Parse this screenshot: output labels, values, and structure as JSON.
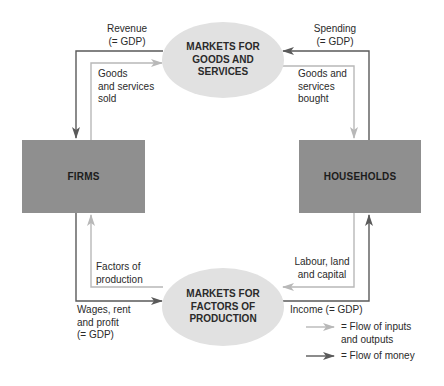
{
  "diagram": {
    "type": "circular-flow",
    "nodes": {
      "firms": {
        "label": "FIRMS"
      },
      "households": {
        "label": "HOUSEHOLDS"
      },
      "goods_market": {
        "label": "MARKETS FOR\nGOODS AND\nSERVICES"
      },
      "factor_market": {
        "label": "MARKETS FOR\nFACTORS OF\nPRODUCTION"
      }
    },
    "flows": {
      "revenue": {
        "label": "Revenue\n(= GDP)",
        "kind": "money",
        "from": "goods_market",
        "to": "firms"
      },
      "goods_sold": {
        "label": "Goods\nand services\nsold",
        "kind": "inputs_outputs",
        "from": "firms",
        "to": "goods_market"
      },
      "spending": {
        "label": "Spending\n(= GDP)",
        "kind": "money",
        "from": "households",
        "to": "goods_market"
      },
      "goods_bought": {
        "label": "Goods and\nservices\nbought",
        "kind": "inputs_outputs",
        "from": "goods_market",
        "to": "households"
      },
      "factors": {
        "label": "Factors of\nproduction",
        "kind": "inputs_outputs",
        "from": "factor_market",
        "to": "firms"
      },
      "wages": {
        "label": "Wages, rent\nand profit\n(= GDP)",
        "kind": "money",
        "from": "firms",
        "to": "factor_market"
      },
      "labour": {
        "label": "Labour, land\nand capital",
        "kind": "inputs_outputs",
        "from": "households",
        "to": "factor_market"
      },
      "income": {
        "label": "Income (= GDP)",
        "kind": "money",
        "from": "factor_market",
        "to": "households"
      }
    },
    "legend": [
      {
        "icon": "light-arrow",
        "label": "= Flow of inputs\nand outputs"
      },
      {
        "icon": "dark-arrow",
        "label": "= Flow of money"
      }
    ],
    "colors": {
      "box": "#8f8f8f",
      "ellipse": "#e1e1e1",
      "money_line": "#5a5a5a",
      "goods_line": "#b8b8b8",
      "text": "#2a2a2a"
    }
  }
}
